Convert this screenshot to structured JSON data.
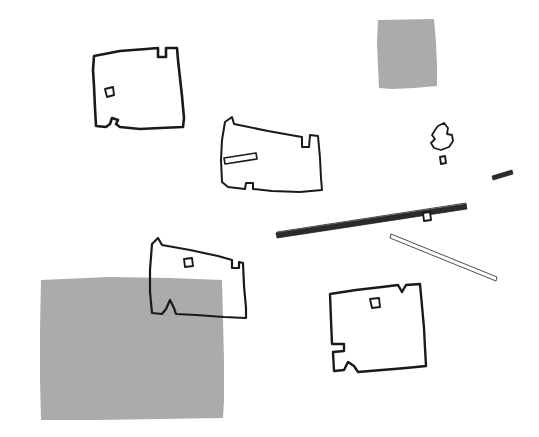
{
  "canvas": {
    "title": "Hand-drawn site plan sketch",
    "width": 539,
    "height": 437,
    "background_color": "#ffffff",
    "ink_color": "#1a1a1a",
    "fill_gray": "#ababab"
  },
  "shapes": [
    {
      "id": "building-top-left",
      "label": "Top-left building outline",
      "kind": "polygon-outline",
      "stroke_width": 2.6,
      "has_interior_marker": true,
      "notches": [
        "top-right-rect-notch",
        "bottom-bump-notch"
      ],
      "path": "M94,56 L120,51 L146,49 L158,48 L158,57 L166,57 L166,48 L177,48 L178,60 L180,78 L182,96 L184,118 L183,127 L160,128 L140,129 L120,127 L116,124 L118,120 L112,118 L110,124 L106,127 L96,126 L95,108 L94,86 L93,70 Z"
    },
    {
      "id": "building-middle",
      "label": "Middle building outline",
      "kind": "polygon-outline",
      "stroke_width": 2.0,
      "has_interior_marker": false,
      "notches": [
        "top-right-v-notch",
        "bottom-right-notch"
      ],
      "path": "M225,122 L232,117 L234,124 L268,131 L296,136 L302,137 L302,147 L309,147 L310,135 L318,136 L320,158 L321,178 L322,190 L300,192 L272,191 L253,189 L253,183 L246,183 L245,189 L228,187 L222,182 L221,160 L222,140 Z"
    },
    {
      "id": "building-lower-middle",
      "label": "Lower-middle building outline (overlaps gray block)",
      "kind": "polygon-outline",
      "stroke_width": 2.2,
      "has_interior_marker": true,
      "notches": [
        "top-left-notch",
        "right-step-notch",
        "bottom-bump-notch"
      ],
      "path": "M152,244 L158,238 L162,245 L190,250 L218,256 L232,260 L232,268 L239,268 L239,262 L243,263 L244,286 L246,308 L246,318 L224,317 L196,315 L176,314 L174,308 L170,300 L166,309 L162,314 L152,313 L150,292 L150,270 Z"
    },
    {
      "id": "building-bottom-right",
      "label": "Bottom-right building outline",
      "kind": "polygon-outline",
      "stroke_width": 2.4,
      "has_interior_marker": true,
      "notches": [
        "top-right-v-notch",
        "left-step-notch",
        "bottom-bump-notch"
      ],
      "path": "M330,294 L356,290 L382,287 L398,285 L402,292 L406,285 L420,284 L422,306 L424,328 L425,348 L426,366 L406,368 L382,370 L358,372 L354,366 L348,362 L344,370 L334,371 L333,352 L344,351 L344,344 L332,344 L331,320 Z"
    },
    {
      "id": "polygon-small-right",
      "label": "Small irregular polygon at right",
      "kind": "polygon-outline",
      "stroke_width": 1.8,
      "has_interior_marker": false,
      "notches": [],
      "path": "M438,126 L444,123 L448,128 L447,134 L452,135 L453,141 L449,147 L441,150 L434,148 L431,143 L435,139 L432,135 L435,130 Z"
    }
  ],
  "gray_blocks": [
    {
      "id": "gray-block-top-right",
      "label": "Gray filled block, upper right",
      "color": "#ababab",
      "path": "M378,20 L434,19 L436,42 L437,66 L437,86 L414,88 L392,89 L379,88 L378,66 L377,42 Z"
    },
    {
      "id": "gray-block-bottom-left",
      "label": "Large gray filled block, lower left",
      "color": "#ababab",
      "path": "M41,280 L108,277 L170,278 L222,280 L223,320 L224,360 L224,400 L223,418 L160,419 L96,420 L41,420 L40,380 L40,330 Z"
    }
  ],
  "bars": [
    {
      "id": "bar-long-diagonal",
      "label": "Long thin diagonal bar",
      "kind": "thin-bar",
      "path": "M276,233 L466,204 L467,209 L277,238 Z"
    },
    {
      "id": "bar-long-diagonal-highlight",
      "label": "Long thin diagonal bar highlight edge",
      "kind": "thin-bar-light",
      "path": "M277,232 L466,203 L466,206 L277,235 Z"
    },
    {
      "id": "bar-short-diagonal",
      "label": "Short thin diagonal bar",
      "kind": "thin-bar-light",
      "path": "M391,234 L497,277 L496,281 L390,238 Z"
    },
    {
      "id": "bar-sliver-right",
      "label": "Small sliver mark at far right",
      "kind": "thin-bar",
      "path": "M492,176 L512,170 L513,174 L493,180 Z"
    }
  ],
  "markers": [
    {
      "id": "marker-top-left",
      "label": "Interior marker, top-left building",
      "path": "M105,89 L113,87 L114,95 L107,97 Z"
    },
    {
      "id": "marker-lower-middle",
      "label": "Interior marker, lower-middle building",
      "path": "M184,259 L192,258 L193,266 L185,267 Z"
    },
    {
      "id": "marker-bottom-right",
      "label": "Interior marker, bottom-right building",
      "path": "M370,299 L379,298 L380,307 L372,308 Z"
    },
    {
      "id": "marker-beside-long-bar",
      "label": "Small marker beside long bar",
      "path": "M423,213 L430,212 L431,220 L424,221 Z"
    },
    {
      "id": "marker-below-polygon",
      "label": "Small marker below right polygon",
      "path": "M440,157 L445,156 L446,163 L441,164 Z"
    }
  ],
  "slots": [
    {
      "id": "slot-middle-building",
      "label": "Thin rectangular slot inside middle building",
      "path": "M224,158 L256,153 L257,159 L225,164 Z"
    }
  ]
}
